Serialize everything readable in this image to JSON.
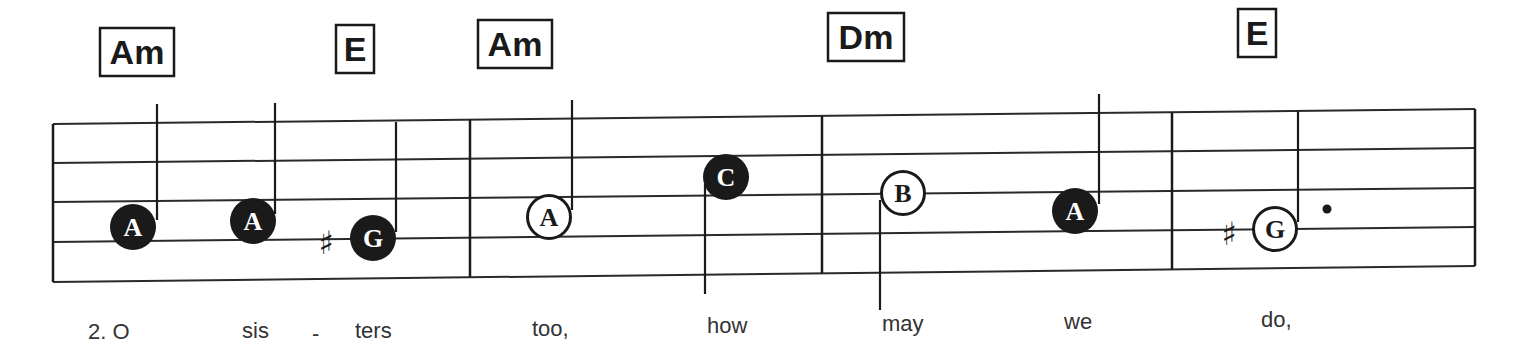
{
  "chords": [
    {
      "label": "Am",
      "x": 137,
      "y": 52,
      "w": 74,
      "h": 48
    },
    {
      "label": "E",
      "x": 355,
      "y": 49,
      "w": 38,
      "h": 48
    },
    {
      "label": "Am",
      "x": 515,
      "y": 44,
      "w": 74,
      "h": 48
    },
    {
      "label": "Dm",
      "x": 866,
      "y": 37,
      "w": 76,
      "h": 48
    },
    {
      "label": "E",
      "x": 1257,
      "y": 33,
      "w": 38,
      "h": 48
    }
  ],
  "staff": {
    "left_x": 53,
    "right_x": 1475,
    "left_ys": [
      124,
      163,
      202,
      242,
      282
    ],
    "right_ys": [
      109,
      148,
      188,
      227,
      266
    ],
    "barlines_x": [
      470,
      822,
      1172
    ]
  },
  "notes": [
    {
      "letter": "A",
      "x": 133,
      "y": 227,
      "style": "filled",
      "stem": "up",
      "stem_x": 157,
      "stem_top": 104,
      "stem_bottom": 220,
      "sharp": false
    },
    {
      "letter": "A",
      "x": 253,
      "y": 221,
      "style": "filled",
      "stem": "up",
      "stem_x": 275,
      "stem_top": 103,
      "stem_bottom": 214,
      "sharp": false
    },
    {
      "letter": "G",
      "x": 373,
      "y": 238,
      "style": "filled",
      "stem": "up",
      "stem_x": 396,
      "stem_top": 122,
      "stem_bottom": 232,
      "sharp": true,
      "sharp_x": 326,
      "sharp_y": 254
    },
    {
      "letter": "A",
      "x": 549,
      "y": 217,
      "style": "open",
      "stem": "up",
      "stem_x": 572,
      "stem_top": 100,
      "stem_bottom": 210,
      "sharp": false
    },
    {
      "letter": "C",
      "x": 726,
      "y": 177,
      "style": "filled",
      "stem": "down",
      "stem_x": 705,
      "stem_top": 184,
      "stem_bottom": 294,
      "sharp": false
    },
    {
      "letter": "B",
      "x": 903,
      "y": 193,
      "style": "open",
      "stem": "down",
      "stem_x": 880,
      "stem_top": 200,
      "stem_bottom": 310,
      "sharp": false
    },
    {
      "letter": "A",
      "x": 1075,
      "y": 211,
      "style": "filled",
      "stem": "up",
      "stem_x": 1099,
      "stem_top": 94,
      "stem_bottom": 204,
      "sharp": false
    },
    {
      "letter": "G",
      "x": 1275,
      "y": 229,
      "style": "open",
      "stem": "up",
      "stem_x": 1298,
      "stem_top": 111,
      "stem_bottom": 222,
      "sharp": true,
      "sharp_x": 1229,
      "sharp_y": 245,
      "dotted": true,
      "dot_x": 1327,
      "dot_y": 209
    }
  ],
  "lyrics": [
    {
      "text": "2.  O",
      "x": 88,
      "y": 339
    },
    {
      "text": "sis",
      "x": 242,
      "y": 338
    },
    {
      "text": "-",
      "x": 312,
      "y": 341
    },
    {
      "text": "ters",
      "x": 355,
      "y": 338
    },
    {
      "text": "too,",
      "x": 532,
      "y": 336
    },
    {
      "text": "how",
      "x": 707,
      "y": 333
    },
    {
      "text": "may",
      "x": 882,
      "y": 331
    },
    {
      "text": "we",
      "x": 1064,
      "y": 329
    },
    {
      "text": "do,",
      "x": 1261,
      "y": 327
    }
  ],
  "symbols": {
    "sharp": "♯"
  }
}
